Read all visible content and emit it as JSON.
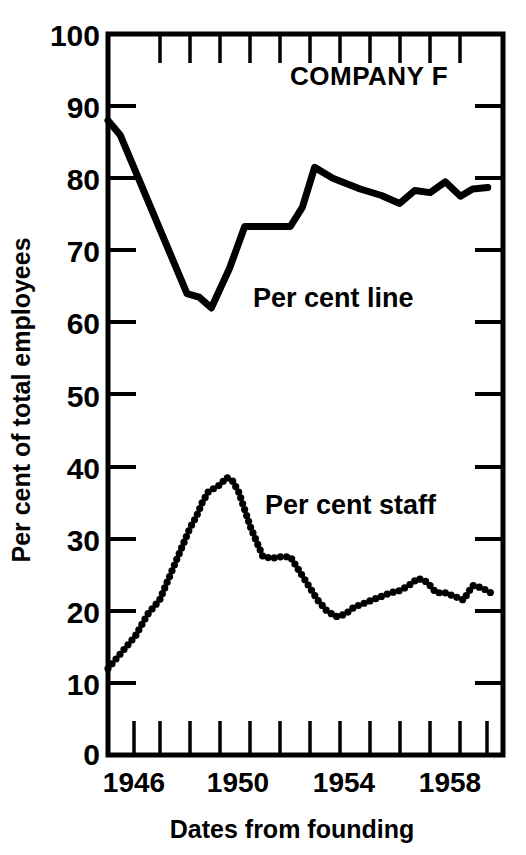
{
  "chart_data": {
    "type": "line",
    "title": "COMPANY F",
    "xlabel": "Dates from founding",
    "ylabel": "Per cent of total employees",
    "xlim": [
      1946,
      1959
    ],
    "ylim": [
      0,
      100
    ],
    "xtick_labels": [
      "1946",
      "1950",
      "1954",
      "1958"
    ],
    "xtick_values": [
      1946,
      1950,
      1954,
      1958
    ],
    "ytick_labels": [
      "0",
      "10",
      "20",
      "30",
      "40",
      "50",
      "60",
      "70",
      "80",
      "90",
      "100"
    ],
    "ytick_values": [
      0,
      10,
      20,
      30,
      40,
      50,
      60,
      70,
      80,
      90,
      100
    ],
    "grid": false,
    "legend_position": "inline-annotation",
    "annotations": [
      {
        "text": "COMPANY F",
        "x": 1952.2,
        "y": 93.5
      },
      {
        "text": "Per cent line",
        "x": 1951.5,
        "y": 64.5
      },
      {
        "text": "Per cent staff",
        "x": 1952.0,
        "y": 36.0
      }
    ],
    "series": [
      {
        "name": "Per cent line",
        "style": "solid",
        "x": [
          1946.0,
          1946.4,
          1947.0,
          1948.0,
          1948.6,
          1949.0,
          1949.4,
          1950.0,
          1950.5,
          1951.3,
          1952.0,
          1952.4,
          1952.8,
          1953.4,
          1954.3,
          1955.0,
          1955.6,
          1956.1,
          1956.6,
          1957.1,
          1957.6,
          1958.0,
          1958.5
        ],
        "values": [
          88.0,
          86.0,
          80.0,
          70.0,
          64.0,
          63.5,
          62.0,
          67.5,
          73.3,
          73.3,
          73.3,
          76.0,
          81.5,
          80.0,
          78.5,
          77.6,
          76.5,
          78.3,
          78.0,
          79.5,
          77.5,
          78.5,
          78.7
        ]
      },
      {
        "name": "Per cent staff",
        "style": "dotted",
        "x": [
          1946.0,
          1946.3,
          1946.6,
          1946.9,
          1947.1,
          1947.3,
          1947.5,
          1947.7,
          1947.9,
          1948.1,
          1948.3,
          1948.5,
          1948.7,
          1948.9,
          1949.1,
          1949.3,
          1949.5,
          1949.7,
          1949.9,
          1950.1,
          1950.3,
          1950.5,
          1950.7,
          1950.9,
          1951.1,
          1951.4,
          1951.7,
          1952.0,
          1952.3,
          1952.6,
          1952.9,
          1953.2,
          1953.5,
          1953.8,
          1954.1,
          1954.4,
          1954.7,
          1955.0,
          1955.3,
          1955.6,
          1955.9,
          1956.2,
          1956.5,
          1956.8,
          1957.1,
          1957.4,
          1957.7,
          1958.0,
          1958.3,
          1958.6
        ],
        "values": [
          12.0,
          13.5,
          15.0,
          16.5,
          18.0,
          19.5,
          20.5,
          21.5,
          23.5,
          25.5,
          27.5,
          29.5,
          31.5,
          33.0,
          35.0,
          36.5,
          37.0,
          37.5,
          38.5,
          38.0,
          36.5,
          34.0,
          31.5,
          29.5,
          27.5,
          27.3,
          27.5,
          27.5,
          25.5,
          23.5,
          21.5,
          20.0,
          19.2,
          19.5,
          20.5,
          21.0,
          21.5,
          22.0,
          22.5,
          22.8,
          23.5,
          24.5,
          24.0,
          22.5,
          22.5,
          22.0,
          21.5,
          23.5,
          23.2,
          22.5
        ]
      }
    ]
  }
}
